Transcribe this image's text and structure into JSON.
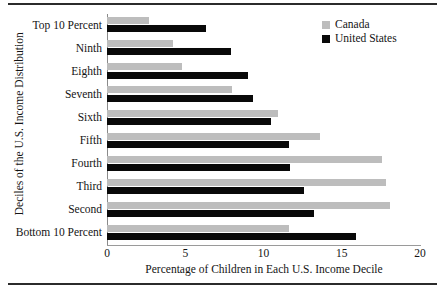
{
  "figure": {
    "has_top_rule": true,
    "has_bottom_rule": true
  },
  "legend": {
    "position": "top-right",
    "entries": [
      {
        "label": "Canada",
        "color": "#bdbdbd",
        "swatch_name": "canada-swatch"
      },
      {
        "label": "United States",
        "color": "#090909",
        "swatch_name": "united-states-swatch"
      }
    ]
  },
  "chart_data": {
    "type": "bar",
    "orientation": "horizontal",
    "title": "",
    "xlabel": "Percentage of Children in Each U.S. Income Decile",
    "ylabel": "Deciles of the U.S. Income Distribution",
    "xlim": [
      0,
      20
    ],
    "xticks": [
      0,
      5,
      10,
      15,
      20
    ],
    "xtick_labels": [
      "0",
      "5",
      "10",
      "15",
      "20"
    ],
    "grid": false,
    "legend_position": "top-right",
    "categories": [
      "Top 10 Percent",
      "Ninth",
      "Eighth",
      "Seventh",
      "Sixth",
      "Fifth",
      "Fourth",
      "Third",
      "Second",
      "Bottom 10 Percent"
    ],
    "series": [
      {
        "name": "Canada",
        "color": "#bdbdbd",
        "values": [
          2.7,
          4.2,
          4.8,
          8.0,
          10.9,
          13.6,
          17.6,
          17.8,
          18.1,
          11.6
        ]
      },
      {
        "name": "United States",
        "color": "#090909",
        "values": [
          6.3,
          7.9,
          9.0,
          9.3,
          10.5,
          11.6,
          11.7,
          12.6,
          13.2,
          15.9
        ]
      }
    ]
  }
}
